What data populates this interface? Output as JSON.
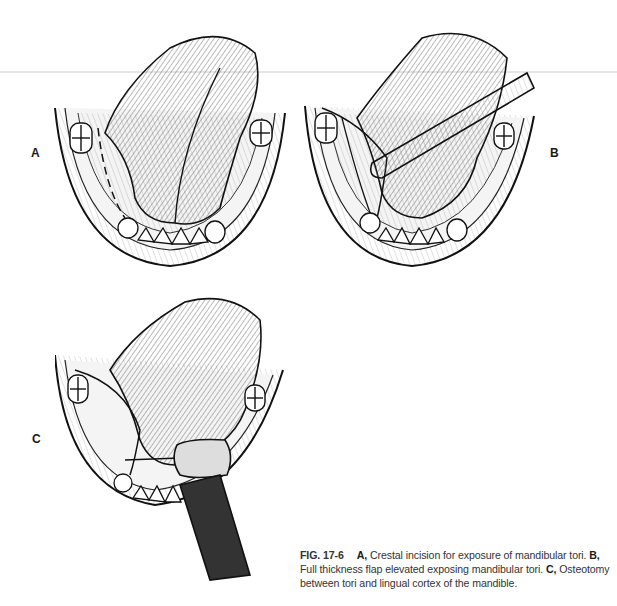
{
  "figure": {
    "number": "FIG. 17-6",
    "panels": [
      {
        "label": "A",
        "description": "Crestal incision for exposure of mandibular tori"
      },
      {
        "label": "B",
        "description": "Full thickness flap elevated exposing mandibular tori"
      },
      {
        "label": "C",
        "description": "Osteotomy between tori and lingual cortex of the mandible"
      }
    ],
    "caption": {
      "a_label": "A,",
      "a_text": "Crestal incision for exposure of mandibular tori.",
      "b_label": "B,",
      "b_text": "Full thickness flap elevated exposing mandibular tori.",
      "c_label": "C,",
      "c_text": "Osteotomy between tori and lingual cortex of the mandible."
    }
  }
}
